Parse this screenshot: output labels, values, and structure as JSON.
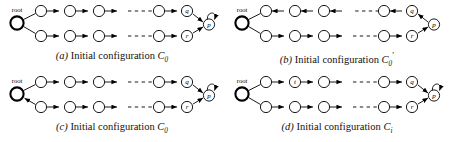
{
  "figure": {
    "type": "diagram",
    "background_color": "#ffffff",
    "stroke_color": "#000000",
    "panels": [
      {
        "id": "a",
        "caption_letter": "(a)",
        "caption_text": "Initial configuration",
        "caption_symbol": "C",
        "caption_subscript": "0",
        "caption_prime": "",
        "root_label": "root",
        "root_bold": true,
        "top_row": {
          "plain_nodes": 4,
          "named_node": "q",
          "direction": "right",
          "dashed_gap_after": 3
        },
        "bottom_row": {
          "plain_nodes": 4,
          "named_node": "r",
          "direction": "right",
          "dashed_gap_after": 3
        },
        "sink_node": "p",
        "sink_self_loop": true,
        "root_incoming_arrow": false
      },
      {
        "id": "b",
        "caption_letter": "(b)",
        "caption_text": "Initial configuration",
        "caption_symbol": "C",
        "caption_subscript": "0",
        "caption_prime": "′",
        "root_label": "root",
        "root_bold": true,
        "top_row": {
          "plain_nodes": 4,
          "named_node": "q",
          "direction": "left",
          "dashed_gap_after": 3
        },
        "bottom_row": {
          "plain_nodes": 4,
          "named_node": "r",
          "direction": "right",
          "dashed_gap_after": 3
        },
        "sink_node": "p",
        "sink_self_loop": false,
        "root_incoming_arrow": false
      },
      {
        "id": "c",
        "caption_letter": "(c)",
        "caption_text": "Initial configuration",
        "caption_symbol": "C",
        "caption_subscript": "0",
        "caption_prime": "",
        "root_label": "root",
        "root_bold": true,
        "top_row": {
          "plain_nodes": 4,
          "named_node": "q",
          "direction": "right",
          "dashed_gap_after": 3
        },
        "bottom_row": {
          "plain_nodes": 4,
          "named_node": "r",
          "direction": "right",
          "dashed_gap_after": 3
        },
        "sink_node": "p",
        "sink_self_loop": true,
        "root_incoming_arrow": true
      },
      {
        "id": "d",
        "caption_letter": "(d)",
        "caption_text": "Initial configuration",
        "caption_symbol": "C",
        "caption_subscript": "i",
        "caption_prime": "",
        "root_label": "root",
        "root_bold": true,
        "top_row": {
          "plain_nodes": 4,
          "named_node": "q",
          "second_node_label": "t",
          "direction": "right",
          "dashed_gap_after": 3
        },
        "bottom_row": {
          "plain_nodes": 4,
          "named_node": "r",
          "direction": "right",
          "dashed_gap_after": 3
        },
        "sink_node": "p",
        "sink_self_loop": true,
        "root_incoming_arrow": false
      }
    ]
  }
}
